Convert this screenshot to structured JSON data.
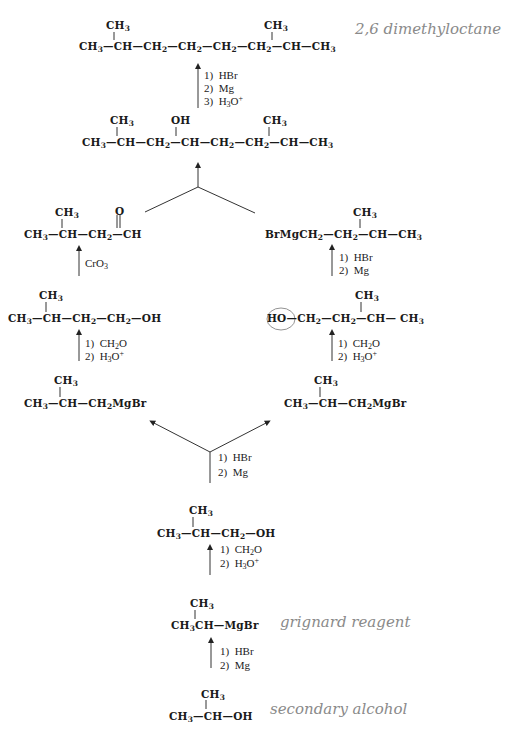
{
  "diagram": {
    "type": "retrosynthesis-scheme",
    "target": {
      "branch_top_left": "CH3",
      "branch_top_right": "CH3",
      "chain": [
        "CH3",
        "CH",
        "CH2",
        "CH2",
        "CH2",
        "CH2",
        "CH",
        "CH3"
      ],
      "annotation": "2,6 dimethyloctane"
    },
    "step1_reagents": [
      "1) HBr",
      "2) Mg",
      "3) H3O+"
    ],
    "alcohol": {
      "substituents": [
        "CH3",
        "OH",
        "CH3"
      ],
      "chain": [
        "CH3",
        "CH",
        "CH2",
        "CH",
        "CH2",
        "CH2",
        "CH",
        "CH3"
      ]
    },
    "left_branch": {
      "aldehyde": {
        "methyl": "CH3",
        "carbonyl_o": "O",
        "chain": [
          "CH3",
          "CH",
          "CH2",
          "CH"
        ]
      },
      "oxidation_reagent": "CrO3",
      "primary_alcohol": {
        "methyl": "CH3",
        "chain": [
          "CH3",
          "CH",
          "CH2",
          "CH2",
          "OH"
        ]
      },
      "reagents": [
        "1) CH2O",
        "2) H3O+"
      ],
      "grignard": {
        "methyl": "CH3",
        "chain": [
          "CH3",
          "CH",
          "CH2MgBr"
        ]
      }
    },
    "right_branch": {
      "grignard": {
        "methyl": "CH3",
        "chain": [
          "BrMgCH2",
          "CH2",
          "CH",
          "CH3"
        ]
      },
      "reagents_grignard": [
        "1) HBr",
        "2) Mg"
      ],
      "primary_alcohol": {
        "methyl": "CH3",
        "chain": [
          "HO",
          "CH2",
          "CH2",
          "CH",
          "CH3"
        ],
        "circled": "HO"
      },
      "reagents": [
        "1) CH2O",
        "2) H3O+"
      ],
      "grignard_start": {
        "methyl": "CH3",
        "chain": [
          "CH3",
          "CH",
          "CH2MgBr"
        ]
      }
    },
    "split_reagents": [
      "1) HBr",
      "2) Mg"
    ],
    "isobutyl_alcohol": {
      "methyl": "CH3",
      "chain": [
        "CH3",
        "CH",
        "CH2",
        "OH"
      ]
    },
    "isobutyl_reagents": [
      "1) CH2O",
      "2) H3O+"
    ],
    "isopropyl_grignard": {
      "methyl": "CH3",
      "chain": [
        "CH3CH",
        "MgBr"
      ],
      "annotation": "grignard reagent"
    },
    "isopropyl_reagents": [
      "1) HBr",
      "2) Mg"
    ],
    "isopropanol": {
      "methyl": "CH3",
      "chain": [
        "CH3",
        "CH",
        "OH"
      ],
      "annotation": "secondary alcohol"
    }
  }
}
